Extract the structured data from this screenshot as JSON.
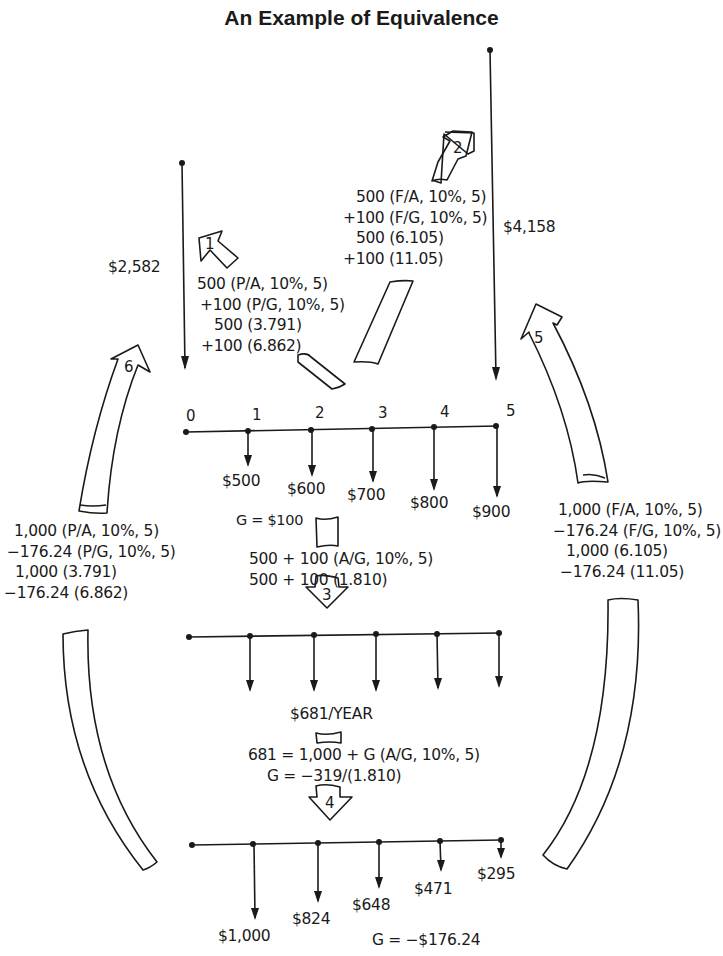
{
  "title": "An Example of Equivalence",
  "colors": {
    "ink": "#1a1a1a",
    "background": "#ffffff"
  },
  "present_worth": {
    "label": "$2,582"
  },
  "future_worth": {
    "label": "$4,158"
  },
  "step1": {
    "number": "1",
    "lines": [
      "500 (P/A, 10%, 5)",
      "+100 (P/G, 10%, 5)",
      "500 (3.791)",
      "+100 (6.862)"
    ]
  },
  "step2": {
    "number": "2",
    "lines": [
      "500 (F/A, 10%, 5)",
      "+100 (F/G, 10%, 5)",
      "500 (6.105)",
      "+100 (11.05)"
    ]
  },
  "step3": {
    "number": "3",
    "lines": [
      "500 + 100 (A/G, 10%, 5)",
      "500 + 100 (1.810)"
    ]
  },
  "step4": {
    "number": "4",
    "lines": [
      "681 = 1,000 + G (A/G, 10%, 5)",
      "G = −319/(1.810)"
    ]
  },
  "step5": {
    "number": "5",
    "lines": [
      "1,000 (F/A, 10%, 5)",
      "−176.24 (F/G, 10%, 5)",
      "1,000 (6.105)",
      "−176.24 (11.05)"
    ]
  },
  "step6": {
    "number": "6",
    "lines": [
      "1,000 (P/A, 10%, 5)",
      "−176.24 (P/G, 10%, 5)",
      "1,000 (3.791)",
      "−176.24 (6.862)"
    ]
  },
  "cashflow_top": {
    "periods": [
      "0",
      "1",
      "2",
      "3",
      "4",
      "5"
    ],
    "amounts": [
      "$500",
      "$600",
      "$700",
      "$800",
      "$900"
    ],
    "gradient_label": "G = $100"
  },
  "cashflow_middle": {
    "annuity_label": "$681/YEAR"
  },
  "cashflow_bottom": {
    "amounts": [
      "$1,000",
      "$824",
      "$648",
      "$471",
      "$295"
    ],
    "gradient_label": "G = −$176.24"
  }
}
